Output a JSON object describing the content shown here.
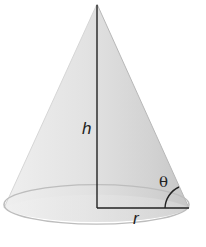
{
  "figure": {
    "type": "right circular cone",
    "labels": {
      "height": "h",
      "radius": "r",
      "angle": "θ"
    },
    "colors": {
      "surface_light": "#f2f2f2",
      "surface_dark": "#cfcfcf",
      "outline": "#bdbdbd",
      "line": "#222222"
    }
  }
}
